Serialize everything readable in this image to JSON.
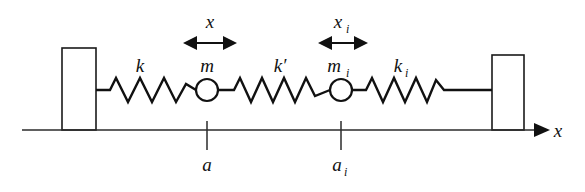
{
  "figure": {
    "kind": "mass-spring-chain-diagram"
  },
  "labels": {
    "spring_k": "k",
    "spring_k_prime": "k′",
    "spring_k_i": "k",
    "spring_k_i_sub": "i",
    "mass_m": "m",
    "mass_m_i": "m",
    "mass_m_i_sub": "i",
    "displacement_x": "x",
    "displacement_x_i": "x",
    "displacement_x_i_sub": "i",
    "position_a": "a",
    "position_a_i": "a",
    "position_a_i_sub": "i",
    "axis_x": "x"
  },
  "elements": {
    "left_wall": "left-fixed-wall",
    "right_wall": "right-fixed-wall",
    "mass_1": "mass-m",
    "mass_2": "mass-m-i",
    "spring_1": "spring-k",
    "spring_2": "spring-k-prime",
    "spring_3": "spring-k-i",
    "arrow_1": "displacement-arrow-x",
    "arrow_2": "displacement-arrow-x-i",
    "axis": "x-axis",
    "tick_1": "tick-a",
    "tick_2": "tick-a-i"
  },
  "geometry": {
    "axis_y": 130,
    "axis_x_start": 22,
    "axis_x_end": 548,
    "spring_center_y": 90,
    "mass_1_x": 207,
    "mass_2_x": 341,
    "mass_radius": 11,
    "left_wall": {
      "x": 62,
      "y": 48,
      "width": 34,
      "height": 82
    },
    "right_wall": {
      "x": 492,
      "y": 55,
      "width": 32,
      "height": 75
    }
  },
  "colors": {
    "stroke": "#111111",
    "axis": "#2b2b2b",
    "background": "#ffffff"
  }
}
